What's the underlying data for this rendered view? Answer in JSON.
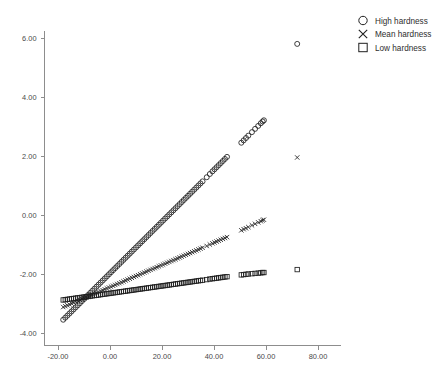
{
  "chart_data": {
    "type": "scatter",
    "title": "",
    "subtitle": "",
    "xlabel": "",
    "ylabel": "",
    "xlim": [
      -24.0,
      88.0
    ],
    "ylim": [
      -4.6,
      6.6
    ],
    "grid": false,
    "background_color": "#ffffff",
    "marker_color": "#1f1f1f",
    "axis_color": "#8d8d8d",
    "legend": {
      "position": "top-right",
      "entries": [
        {
          "label": "High hardness",
          "marker": "circle"
        },
        {
          "label": "Mean hardness",
          "marker": "x"
        },
        {
          "label": "Low hardness",
          "marker": "square"
        }
      ]
    },
    "xticks": [
      -20.0,
      0.0,
      20.0,
      40.0,
      60.0,
      80.0
    ],
    "xticklabels": [
      "-20.00",
      "0.00",
      "20.00",
      "40.00",
      "60.00",
      "80.00"
    ],
    "yticks": [
      -4.0,
      -2.0,
      0.0,
      2.0,
      4.0,
      6.0
    ],
    "yticklabels": [
      "-4.00",
      "-2.00",
      "0.00",
      "2.00",
      "4.00",
      "6.00"
    ],
    "series": [
      {
        "name": "High hardness",
        "marker": "circle",
        "x": [
          -18.0,
          -17.2,
          -16.4,
          -15.6,
          -14.8,
          -14.0,
          -13.2,
          -12.4,
          -11.6,
          -10.8,
          -10.0,
          -9.2,
          -8.4,
          -7.6,
          -6.8,
          -6.0,
          -5.2,
          -4.4,
          -3.6,
          -2.8,
          -2.0,
          -1.2,
          -0.4,
          0.4,
          1.2,
          2.0,
          2.8,
          3.6,
          4.4,
          5.2,
          6.0,
          6.8,
          7.6,
          8.4,
          9.2,
          10.0,
          10.8,
          11.6,
          12.4,
          13.2,
          14.0,
          14.8,
          15.6,
          16.4,
          17.2,
          18.0,
          18.8,
          19.6,
          20.4,
          21.2,
          22.0,
          22.8,
          23.6,
          24.4,
          25.2,
          26.0,
          26.8,
          27.6,
          28.4,
          29.2,
          30.0,
          30.8,
          31.6,
          32.4,
          33.2,
          34.0,
          34.8,
          35.6,
          37.2,
          38.4,
          39.4,
          40.2,
          41.0,
          41.8,
          42.6,
          43.4,
          44.2,
          45.0,
          50.5,
          51.4,
          52.3,
          53.2,
          54.6,
          55.8,
          57.0,
          58.0,
          58.7,
          59.2,
          72.0
        ],
        "y": [
          -3.55,
          -3.48,
          -3.41,
          -3.34,
          -3.27,
          -3.2,
          -3.13,
          -3.06,
          -2.99,
          -2.92,
          -2.85,
          -2.78,
          -2.71,
          -2.64,
          -2.57,
          -2.5,
          -2.43,
          -2.36,
          -2.29,
          -2.22,
          -2.15,
          -2.08,
          -2.01,
          -1.94,
          -1.87,
          -1.8,
          -1.73,
          -1.66,
          -1.59,
          -1.52,
          -1.45,
          -1.38,
          -1.31,
          -1.24,
          -1.17,
          -1.1,
          -1.03,
          -0.96,
          -0.89,
          -0.82,
          -0.75,
          -0.68,
          -0.61,
          -0.54,
          -0.47,
          -0.4,
          -0.33,
          -0.26,
          -0.19,
          -0.12,
          -0.05,
          0.02,
          0.09,
          0.16,
          0.23,
          0.3,
          0.37,
          0.44,
          0.51,
          0.58,
          0.65,
          0.72,
          0.79,
          0.86,
          0.93,
          1.0,
          1.07,
          1.14,
          1.28,
          1.39,
          1.48,
          1.55,
          1.62,
          1.69,
          1.76,
          1.83,
          1.9,
          1.97,
          2.45,
          2.53,
          2.61,
          2.69,
          2.81,
          2.92,
          3.02,
          3.11,
          3.17,
          3.21,
          5.8
        ]
      },
      {
        "name": "Mean hardness",
        "marker": "x",
        "x": [
          -18.0,
          -17.2,
          -16.4,
          -15.6,
          -14.8,
          -14.0,
          -13.2,
          -12.4,
          -11.6,
          -10.8,
          -10.0,
          -9.2,
          -8.4,
          -7.6,
          -6.8,
          -6.0,
          -5.2,
          -4.4,
          -3.6,
          -2.8,
          -2.0,
          -1.2,
          -0.4,
          0.4,
          1.2,
          2.0,
          2.8,
          3.6,
          4.4,
          5.2,
          6.0,
          6.8,
          7.6,
          8.4,
          9.2,
          10.0,
          10.8,
          11.6,
          12.4,
          13.2,
          14.0,
          14.8,
          15.6,
          16.4,
          17.2,
          18.0,
          18.8,
          19.6,
          20.4,
          21.2,
          22.0,
          22.8,
          23.6,
          24.4,
          25.2,
          26.0,
          26.8,
          27.6,
          28.4,
          29.2,
          30.0,
          30.8,
          31.6,
          32.4,
          33.2,
          34.0,
          34.8,
          35.6,
          37.2,
          38.4,
          39.4,
          40.2,
          41.0,
          41.8,
          42.6,
          43.4,
          44.2,
          45.0,
          50.5,
          51.4,
          52.3,
          53.2,
          54.6,
          55.8,
          57.0,
          58.0,
          58.7,
          59.2,
          72.0
        ],
        "y": [
          -3.12,
          -3.09,
          -3.06,
          -3.03,
          -3.0,
          -2.97,
          -2.94,
          -2.91,
          -2.88,
          -2.85,
          -2.82,
          -2.79,
          -2.76,
          -2.73,
          -2.7,
          -2.67,
          -2.64,
          -2.61,
          -2.58,
          -2.55,
          -2.52,
          -2.49,
          -2.46,
          -2.43,
          -2.4,
          -2.37,
          -2.34,
          -2.31,
          -2.28,
          -2.25,
          -2.22,
          -2.19,
          -2.16,
          -2.13,
          -2.1,
          -2.07,
          -2.04,
          -2.01,
          -1.98,
          -1.95,
          -1.92,
          -1.89,
          -1.86,
          -1.83,
          -1.8,
          -1.77,
          -1.74,
          -1.71,
          -1.68,
          -1.65,
          -1.62,
          -1.59,
          -1.56,
          -1.53,
          -1.5,
          -1.47,
          -1.44,
          -1.41,
          -1.38,
          -1.35,
          -1.32,
          -1.29,
          -1.26,
          -1.23,
          -1.2,
          -1.17,
          -1.14,
          -1.11,
          -1.05,
          -1.0,
          -0.96,
          -0.93,
          -0.9,
          -0.87,
          -0.84,
          -0.81,
          -0.78,
          -0.75,
          -0.52,
          -0.48,
          -0.45,
          -0.41,
          -0.35,
          -0.3,
          -0.25,
          -0.21,
          -0.18,
          -0.16,
          1.95
        ]
      },
      {
        "name": "Low hardness",
        "marker": "square",
        "x": [
          -18.0,
          -17.2,
          -16.4,
          -15.6,
          -14.8,
          -14.0,
          -13.2,
          -12.4,
          -11.6,
          -10.8,
          -10.0,
          -9.2,
          -8.4,
          -7.6,
          -6.8,
          -6.0,
          -5.2,
          -4.4,
          -3.6,
          -2.8,
          -2.0,
          -1.2,
          -0.4,
          0.4,
          1.2,
          2.0,
          2.8,
          3.6,
          4.4,
          5.2,
          6.0,
          6.8,
          7.6,
          8.4,
          9.2,
          10.0,
          10.8,
          11.6,
          12.4,
          13.2,
          14.0,
          14.8,
          15.6,
          16.4,
          17.2,
          18.0,
          18.8,
          19.6,
          20.4,
          21.2,
          22.0,
          22.8,
          23.6,
          24.4,
          25.2,
          26.0,
          26.8,
          27.6,
          28.4,
          29.2,
          30.0,
          30.8,
          31.6,
          32.4,
          33.2,
          34.0,
          34.8,
          35.6,
          37.2,
          38.4,
          39.4,
          40.2,
          41.0,
          41.8,
          42.6,
          43.4,
          44.2,
          45.0,
          50.5,
          51.4,
          52.3,
          53.2,
          54.6,
          55.8,
          57.0,
          58.0,
          58.7,
          59.2,
          72.0
        ],
        "y": [
          -2.88,
          -2.87,
          -2.86,
          -2.85,
          -2.84,
          -2.83,
          -2.82,
          -2.81,
          -2.8,
          -2.79,
          -2.78,
          -2.77,
          -2.76,
          -2.75,
          -2.74,
          -2.73,
          -2.72,
          -2.71,
          -2.7,
          -2.69,
          -2.68,
          -2.67,
          -2.66,
          -2.65,
          -2.64,
          -2.63,
          -2.62,
          -2.61,
          -2.6,
          -2.59,
          -2.58,
          -2.57,
          -2.56,
          -2.55,
          -2.54,
          -2.53,
          -2.52,
          -2.51,
          -2.5,
          -2.49,
          -2.48,
          -2.47,
          -2.46,
          -2.45,
          -2.44,
          -2.43,
          -2.42,
          -2.41,
          -2.4,
          -2.39,
          -2.38,
          -2.37,
          -2.36,
          -2.35,
          -2.34,
          -2.33,
          -2.32,
          -2.31,
          -2.3,
          -2.29,
          -2.28,
          -2.27,
          -2.26,
          -2.25,
          -2.24,
          -2.23,
          -2.22,
          -2.21,
          -2.19,
          -2.17,
          -2.16,
          -2.15,
          -2.14,
          -2.13,
          -2.12,
          -2.11,
          -2.1,
          -2.09,
          -2.03,
          -2.02,
          -2.01,
          -2.0,
          -1.99,
          -1.98,
          -1.97,
          -1.96,
          -1.95,
          -1.95,
          -1.85
        ]
      }
    ]
  }
}
